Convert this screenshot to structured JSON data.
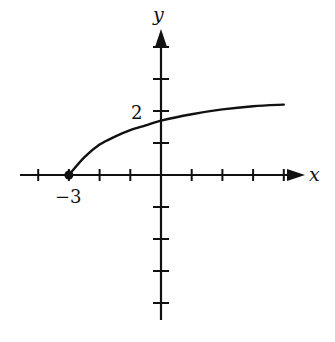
{
  "chart_data": {
    "type": "line",
    "title": "",
    "xlabel": "x",
    "ylabel": "y",
    "xlim": [
      -4,
      4
    ],
    "ylim": [
      -5,
      4
    ],
    "grid": false,
    "legend": null,
    "tick_labels": {
      "x": [
        {
          "value": -3,
          "label": "−3"
        }
      ],
      "y": [
        {
          "value": 2,
          "label": "2"
        }
      ]
    },
    "x_ticks": [
      -4,
      -3,
      -2,
      -1,
      1,
      2,
      3,
      4
    ],
    "y_ticks": [
      -4,
      -3,
      -2,
      -1,
      1,
      2,
      3,
      4
    ],
    "series": [
      {
        "name": "f(x)",
        "x": [
          -3,
          -2.5,
          -2,
          -1.5,
          -1,
          -0.5,
          0,
          1,
          2,
          3,
          4
        ],
        "y": [
          0,
          0.55,
          0.95,
          1.2,
          1.4,
          1.55,
          1.7,
          1.9,
          2.05,
          2.15,
          2.2
        ],
        "start_point": {
          "x": -3,
          "y": 0,
          "marker": "filled-dot"
        }
      }
    ],
    "annotations": []
  },
  "labels": {
    "x_axis": "x",
    "y_axis": "y",
    "x_tick_neg3": "−3",
    "y_tick_2": "2"
  }
}
